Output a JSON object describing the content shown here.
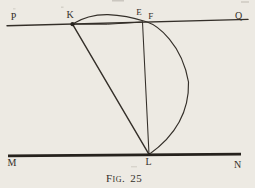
{
  "figure": {
    "caption": {
      "label": "Fig.",
      "number": "25"
    },
    "points": {
      "P": "P",
      "K": "K",
      "E": "E",
      "F": "F",
      "Q": "Q",
      "M": "M",
      "L": "L",
      "N": "N"
    }
  },
  "colors": {
    "paper": "#edeae3",
    "ink": "#342f29",
    "ink_strong": "#26221d"
  }
}
